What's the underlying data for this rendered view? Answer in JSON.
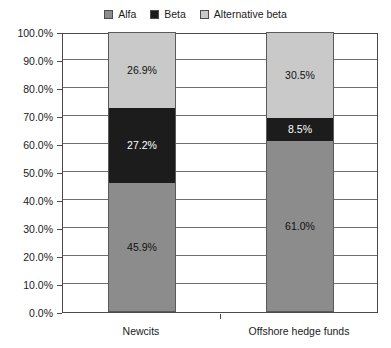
{
  "chart_data": {
    "type": "bar",
    "stacked": true,
    "stack_mode": "percent",
    "title": "",
    "subtitle": "",
    "xlabel": "",
    "ylabel": "",
    "ylim": [
      0,
      100
    ],
    "y_tick_step": 10,
    "grid": true,
    "legend_position": "top",
    "categories": [
      "Newcits",
      "Offshore hedge funds"
    ],
    "y_tick_labels": [
      "0.0%",
      "10.0%",
      "20.0%",
      "30.0%",
      "40.0%",
      "50.0%",
      "60.0%",
      "70.0%",
      "80.0%",
      "90.0%",
      "100.0%"
    ],
    "series": [
      {
        "name": "Alfa",
        "color": "#8c8c8c",
        "label_color": "#111111",
        "values": [
          45.9,
          61.0
        ],
        "value_labels": [
          "45.9%",
          "61.0%"
        ]
      },
      {
        "name": "Beta",
        "color": "#1c1c1c",
        "label_color": "#ffffff",
        "values": [
          27.2,
          8.5
        ],
        "value_labels": [
          "27.2%",
          "8.5%"
        ]
      },
      {
        "name": "Alternative beta",
        "color": "#c9c9c9",
        "label_color": "#111111",
        "values": [
          26.9,
          30.5
        ],
        "value_labels": [
          "26.9%",
          "30.5%"
        ]
      }
    ]
  },
  "legend": {
    "items": [
      {
        "label": "Alfa",
        "color": "#8c8c8c"
      },
      {
        "label": "Beta",
        "color": "#1c1c1c"
      },
      {
        "label": "Alternative beta",
        "color": "#c9c9c9"
      }
    ]
  },
  "axis": {
    "y_labels": [
      "100.0%",
      "90.0%",
      "80.0%",
      "70.0%",
      "60.0%",
      "50.0%",
      "40.0%",
      "30.0%",
      "20.0%",
      "10.0%",
      "0.0%"
    ],
    "x_labels": [
      "Newcits",
      "Offshore hedge funds"
    ]
  }
}
